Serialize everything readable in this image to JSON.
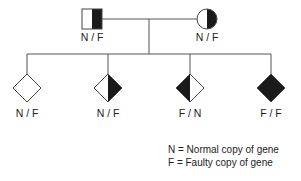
{
  "diagram": {
    "type": "pedigree",
    "colors": {
      "filled": "#1a1a1a",
      "empty": "#ffffff",
      "line": "#555555"
    },
    "parents": [
      {
        "role": "father",
        "shape": "square",
        "genotype": "N / F",
        "fill": "half-right"
      },
      {
        "role": "mother",
        "shape": "circle",
        "genotype": "N / F",
        "fill": "half-right"
      }
    ],
    "children": [
      {
        "shape": "diamond",
        "genotype": "N / F",
        "fill": "none"
      },
      {
        "shape": "diamond",
        "genotype": "N / F",
        "fill": "half-right"
      },
      {
        "shape": "diamond",
        "genotype": "F / N",
        "fill": "half-left"
      },
      {
        "shape": "diamond",
        "genotype": "F / F",
        "fill": "full"
      }
    ],
    "legend": [
      {
        "text": "N = Normal copy of gene"
      },
      {
        "text": "F = Faulty copy of gene"
      }
    ]
  }
}
